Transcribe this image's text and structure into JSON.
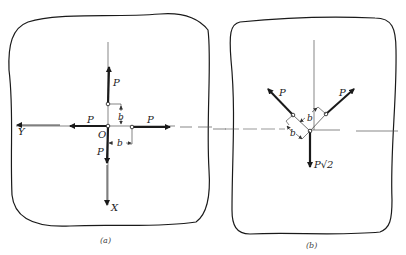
{
  "figure_a": {
    "caption": "(a)",
    "force_up": "P",
    "force_left": "P",
    "force_right": "P",
    "force_down": "P",
    "origin": "O",
    "dim_vertical": "b",
    "dim_horizontal": "b",
    "axis_y": "Y",
    "axis_x": "X"
  },
  "figure_b": {
    "caption": "(b)",
    "force_upper_left": "P",
    "force_upper_right": "P",
    "force_down": "P√2",
    "dim_upper": "b",
    "dim_lower": "b"
  },
  "colors": {
    "ink": "#1a1a1a",
    "thin": "#555555",
    "background": "#ffffff"
  }
}
